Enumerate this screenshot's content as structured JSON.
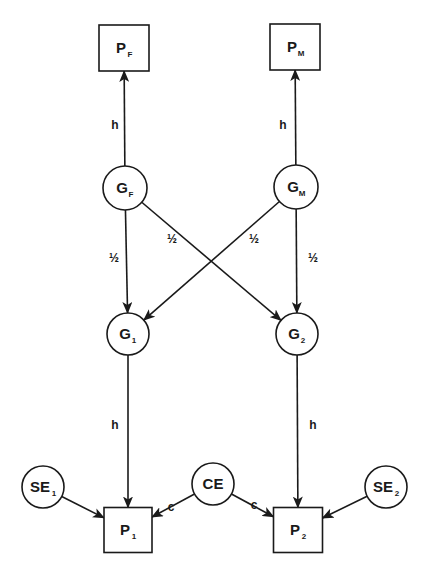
{
  "diagram": {
    "type": "path-diagram",
    "colors": {
      "stroke": "#1a1a1a",
      "background": "#ffffff"
    },
    "nodes": [
      {
        "id": "PF",
        "shape": "box",
        "label": "P",
        "sub": "F",
        "x": 124,
        "y": 48,
        "w": 50,
        "h": 46
      },
      {
        "id": "PM",
        "shape": "box",
        "label": "P",
        "sub": "M",
        "x": 295,
        "y": 47,
        "w": 50,
        "h": 46
      },
      {
        "id": "GF",
        "shape": "circle",
        "label": "G",
        "sub": "F",
        "x": 125,
        "y": 188,
        "r": 22
      },
      {
        "id": "GM",
        "shape": "circle",
        "label": "G",
        "sub": "M",
        "x": 296,
        "y": 187,
        "r": 22
      },
      {
        "id": "G1",
        "shape": "circle",
        "label": "G",
        "sub": "1",
        "x": 128,
        "y": 334,
        "r": 21
      },
      {
        "id": "G2",
        "shape": "circle",
        "label": "G",
        "sub": "2",
        "x": 297,
        "y": 334,
        "r": 21
      },
      {
        "id": "SE1",
        "shape": "circle",
        "label": "SE",
        "sub": "1",
        "x": 43,
        "y": 487,
        "r": 21
      },
      {
        "id": "CE",
        "shape": "circle",
        "label": "CE",
        "sub": "",
        "x": 213,
        "y": 484,
        "r": 21
      },
      {
        "id": "SE2",
        "shape": "circle",
        "label": "SE",
        "sub": "2",
        "x": 386,
        "y": 487,
        "r": 21
      },
      {
        "id": "P1",
        "shape": "box",
        "label": "P",
        "sub": "1",
        "x": 128,
        "y": 530,
        "w": 48,
        "h": 45
      },
      {
        "id": "P2",
        "shape": "box",
        "label": "P",
        "sub": "2",
        "x": 298,
        "y": 530,
        "w": 49,
        "h": 45
      }
    ],
    "edges": [
      {
        "from": "GF",
        "to": "PF",
        "label": "h",
        "lx": 115,
        "ly": 129
      },
      {
        "from": "GM",
        "to": "PM",
        "label": "h",
        "lx": 283,
        "ly": 129
      },
      {
        "from": "GF",
        "to": "G1",
        "label": "½",
        "lx": 114,
        "ly": 262
      },
      {
        "from": "GF",
        "to": "G2",
        "label": "½",
        "lx": 172,
        "ly": 243
      },
      {
        "from": "GM",
        "to": "G1",
        "label": "½",
        "lx": 254,
        "ly": 243
      },
      {
        "from": "GM",
        "to": "G2",
        "label": "½",
        "lx": 313,
        "ly": 262
      },
      {
        "from": "G1",
        "to": "P1",
        "label": "h",
        "lx": 115,
        "ly": 429
      },
      {
        "from": "G2",
        "to": "P2",
        "label": "h",
        "lx": 313,
        "ly": 429
      },
      {
        "from": "SE1",
        "to": "P1",
        "label": "",
        "lx": 0,
        "ly": 0
      },
      {
        "from": "CE",
        "to": "P1",
        "label": "c",
        "lx": 171,
        "ly": 511
      },
      {
        "from": "CE",
        "to": "P2",
        "label": "c",
        "lx": 254,
        "ly": 509
      },
      {
        "from": "SE2",
        "to": "P2",
        "label": "",
        "lx": 0,
        "ly": 0
      }
    ]
  }
}
